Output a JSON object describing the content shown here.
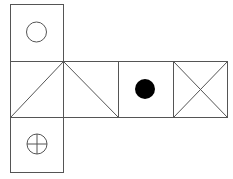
{
  "diagram": {
    "type": "cube-net",
    "stroke_color": "#555555",
    "fill_dot_color": "#000000",
    "faces": [
      {
        "id": "top",
        "symbol": "circle-outline"
      },
      {
        "id": "middle-1",
        "symbol": "two-diagonals-from-top-right-corner"
      },
      {
        "id": "middle-2",
        "symbol": "one-diagonal-from-top-left-corner"
      },
      {
        "id": "middle-3",
        "symbol": "filled-dot"
      },
      {
        "id": "middle-4",
        "symbol": "x-cross"
      },
      {
        "id": "bottom",
        "symbol": "circle-with-cross"
      }
    ]
  }
}
